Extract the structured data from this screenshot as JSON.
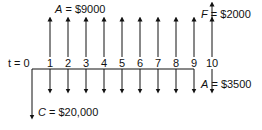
{
  "diagram": {
    "type": "cash-flow",
    "time_label": "t = 0",
    "periods": [
      "1",
      "2",
      "3",
      "4",
      "5",
      "6",
      "7",
      "8",
      "9",
      "10"
    ],
    "labels": {
      "annual_income": {
        "var": "A",
        "text": " = $9000"
      },
      "future_value": {
        "var": "F",
        "text": " = $2000"
      },
      "annual_cost": {
        "var": "A",
        "text": " = $3500"
      },
      "initial_cost": {
        "var": "C",
        "text": " = $20,000"
      }
    },
    "flows": [
      {
        "name": "initial_cost",
        "t": 0,
        "direction": "down",
        "amount": 20000
      },
      {
        "name": "annual_income",
        "t_range": [
          1,
          10
        ],
        "direction": "up",
        "amount": 9000
      },
      {
        "name": "annual_cost",
        "t_range": [
          1,
          10
        ],
        "direction": "down",
        "amount": 3500
      },
      {
        "name": "future_value",
        "t": 10,
        "direction": "up",
        "amount": 2000
      }
    ]
  }
}
